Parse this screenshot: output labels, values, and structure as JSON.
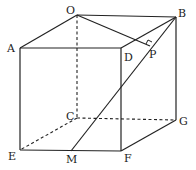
{
  "diagram": {
    "type": "geometry-cube",
    "points": {
      "O": {
        "label": "O",
        "x": 77,
        "y": 15
      },
      "B": {
        "label": "B",
        "x": 176,
        "y": 17
      },
      "A": {
        "label": "A",
        "x": 20,
        "y": 48
      },
      "D": {
        "label": "D",
        "x": 121,
        "y": 48
      },
      "P": {
        "label": "P",
        "x": 150,
        "y": 46
      },
      "C": {
        "label": "C",
        "x": 77,
        "y": 118
      },
      "G": {
        "label": "G",
        "x": 176,
        "y": 120
      },
      "E": {
        "label": "E",
        "x": 20,
        "y": 150
      },
      "F": {
        "label": "F",
        "x": 121,
        "y": 151
      },
      "M": {
        "label": "M",
        "x": 71,
        "y": 151
      }
    },
    "solid_edges": [
      "OB",
      "OA",
      "AD",
      "BD",
      "OP",
      "AE",
      "DF",
      "BG",
      "EF",
      "FG",
      "BM"
    ],
    "dashed_edges": [
      "OC",
      "CE",
      "CG"
    ],
    "right_angle_marker": "P",
    "line_color": "#222222"
  }
}
